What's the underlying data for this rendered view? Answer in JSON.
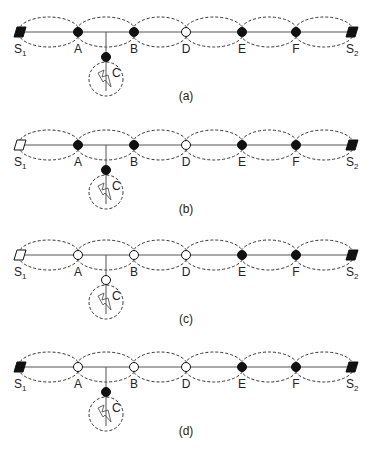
{
  "figure": {
    "width": 373,
    "height": 459,
    "colors": {
      "line": "#555555",
      "dash": "#333333",
      "filled": "#111111",
      "open": "#ffffff",
      "text": "#222222"
    },
    "layout": {
      "panel_line_y": [
        32,
        145,
        255,
        367
      ],
      "node_x": {
        "S1": 20,
        "A": 78,
        "B": 134,
        "D": 186,
        "E": 242,
        "F": 296,
        "S2": 352
      },
      "tap_x": 106,
      "c_offset_y": 25,
      "fault_circle_offset_y": 47,
      "fault_circle_r": 17,
      "panel_label_x": 186,
      "panel_label_offset_y": 68
    },
    "labels": {
      "S1": {
        "main": "S",
        "sub": "1"
      },
      "S2": {
        "main": "S",
        "sub": "2"
      },
      "A": "A",
      "B": "B",
      "C": "C",
      "D": "D",
      "E": "E",
      "F": "F"
    },
    "panels": [
      {
        "id": "a",
        "label": "(a)",
        "states": {
          "S1": "closed",
          "A": "closed",
          "B": "closed",
          "C": "closed",
          "D": "open",
          "E": "closed",
          "F": "closed",
          "S2": "closed"
        }
      },
      {
        "id": "b",
        "label": "(b)",
        "states": {
          "S1": "open",
          "A": "closed",
          "B": "closed",
          "C": "closed",
          "D": "open",
          "E": "closed",
          "F": "closed",
          "S2": "closed"
        }
      },
      {
        "id": "c",
        "label": "(c)",
        "states": {
          "S1": "open",
          "A": "open",
          "B": "open",
          "C": "open",
          "D": "open",
          "E": "closed",
          "F": "closed",
          "S2": "closed"
        }
      },
      {
        "id": "d",
        "label": "(d)",
        "states": {
          "S1": "closed",
          "A": "open",
          "B": "open",
          "C": "closed",
          "D": "open",
          "E": "closed",
          "F": "closed",
          "S2": "closed"
        }
      }
    ],
    "legend_semantics": {
      "filled": "closed switch / recloser",
      "open": "open switch",
      "square": "source breaker",
      "lightning": "fault location"
    }
  }
}
